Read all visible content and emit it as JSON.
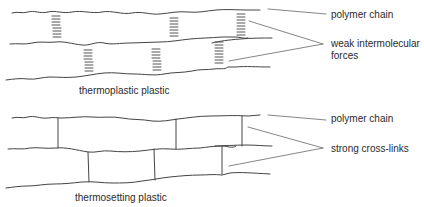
{
  "diagram": {
    "thermoplastic": {
      "caption": "thermoplastic plastic",
      "labels": {
        "polymer_chain": "polymer chain",
        "forces_line1": "weak intermolecular",
        "forces_line2": "forces"
      }
    },
    "thermosetting": {
      "caption": "thermosetting plastic",
      "labels": {
        "polymer_chain": "polymer chain",
        "cross_links": "strong cross-links"
      }
    }
  }
}
